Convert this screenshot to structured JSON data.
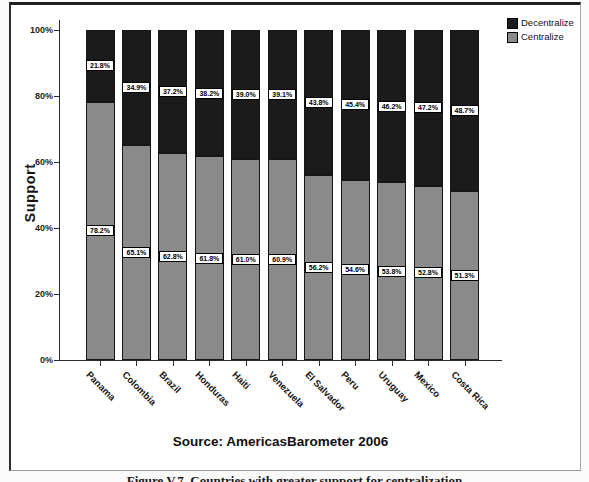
{
  "figure": {
    "source_text": "Source: AmericasBarometer 2006",
    "caption": "Figure V.7. Countries with greater support for centralization"
  },
  "chart_data": {
    "type": "bar",
    "stacked": true,
    "title": "",
    "xlabel": "",
    "ylabel": "Support",
    "ylim": [
      0,
      100
    ],
    "yticks": [
      0,
      20,
      40,
      60,
      80,
      100
    ],
    "ytick_labels": [
      "0%",
      "20%",
      "40%",
      "60%",
      "80%",
      "100%"
    ],
    "categories": [
      "Panama",
      "Colombia",
      "Brazil",
      "Honduras",
      "Haiti",
      "Venezuela",
      "El Salvador",
      "Peru",
      "Uruguay",
      "Mexico",
      "Costa Rica"
    ],
    "series": [
      {
        "name": "Centralize",
        "color": "#8a8a8a",
        "values": [
          78.2,
          65.1,
          62.8,
          61.8,
          61.0,
          60.9,
          56.2,
          54.6,
          53.8,
          52.8,
          51.3
        ]
      },
      {
        "name": "Decentralize",
        "color": "#1b1b1b",
        "values": [
          21.8,
          34.9,
          37.2,
          38.2,
          39.0,
          39.1,
          43.8,
          45.4,
          46.2,
          47.2,
          48.7
        ]
      }
    ],
    "legend": {
      "position": "top-right",
      "entries": [
        "Decentralize",
        "Centralize"
      ]
    },
    "data_labels": true,
    "grid": false
  }
}
